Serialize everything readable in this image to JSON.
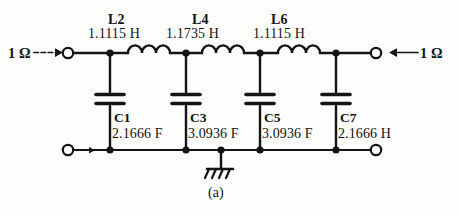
{
  "figure": {
    "caption": "(a)"
  },
  "ports": {
    "source": {
      "label": "1 Ω",
      "arrow": "arrow-right-icon"
    },
    "load": {
      "label": "1 Ω",
      "arrow": "arrow-left-icon"
    }
  },
  "ground": {
    "symbol": "ground-icon"
  },
  "components": {
    "inductors": [
      {
        "ref": "L2",
        "value": "1.1115 H"
      },
      {
        "ref": "L4",
        "value": "1.1735 H"
      },
      {
        "ref": "L6",
        "value": "1.1115 H"
      }
    ],
    "capacitors": [
      {
        "ref": "C1",
        "value": "2.1666 F"
      },
      {
        "ref": "C3",
        "value": "3.0936 F"
      },
      {
        "ref": "C5",
        "value": "3.0936 F"
      },
      {
        "ref": "C7",
        "value": "2.1666 H"
      }
    ]
  },
  "colors": {
    "ink": "#141414",
    "paper": "#fdfdfc"
  }
}
